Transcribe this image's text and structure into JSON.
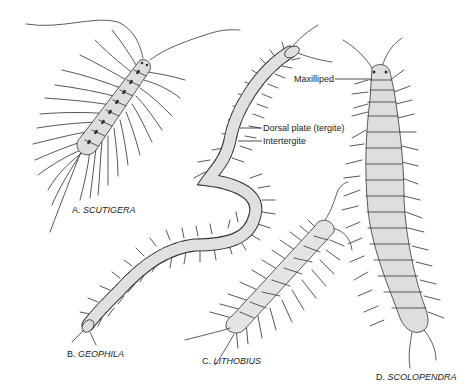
{
  "figure": {
    "background": "#ffffff",
    "line_color": "#333333",
    "fill_color": "#dcdcdc",
    "specimens": [
      {
        "letter": "A.",
        "name": "SCUTIGERA"
      },
      {
        "letter": "B.",
        "name": "GEOPHILA"
      },
      {
        "letter": "C.",
        "name": "LITHOBIUS"
      },
      {
        "letter": "D.",
        "name": "SCOLOPENDRA"
      }
    ],
    "callouts": {
      "maxilliped": "Maxilliped",
      "dorsal_plate": "Dorsal plate (tergite)",
      "intertergite": "Intertergite"
    }
  }
}
